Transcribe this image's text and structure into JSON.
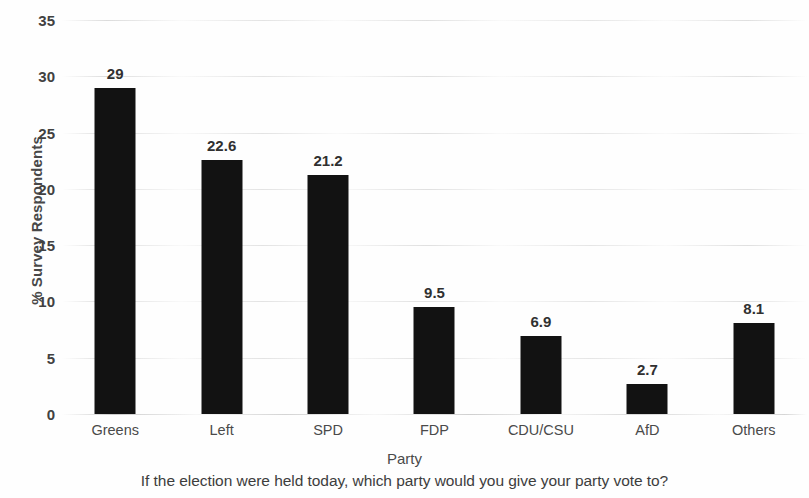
{
  "chart_data": {
    "type": "bar",
    "title": "",
    "categories": [
      "Greens",
      "Left",
      "SPD",
      "FDP",
      "CDU/CSU",
      "AfD",
      "Others"
    ],
    "values": [
      29,
      22.6,
      21.2,
      9.5,
      6.9,
      2.7,
      8.1
    ],
    "value_labels": [
      "29",
      "22.6",
      "21.2",
      "9.5",
      "6.9",
      "2.7",
      "8.1"
    ],
    "xlabel": "Party",
    "ylabel": "% Survey Respondents",
    "ylim": [
      0,
      35
    ],
    "yticks": [
      0,
      5,
      10,
      15,
      20,
      25,
      30,
      35
    ],
    "ytick_labels": [
      "0",
      "5",
      "10",
      "15",
      "20",
      "25",
      "30",
      "35"
    ],
    "grid": true,
    "legend": false,
    "caption": "If the election were held today, which party would you give your party vote to?",
    "bar_color": "#121212",
    "grid_color": "#c8c8c8",
    "text_color": "#3d3d3d"
  }
}
